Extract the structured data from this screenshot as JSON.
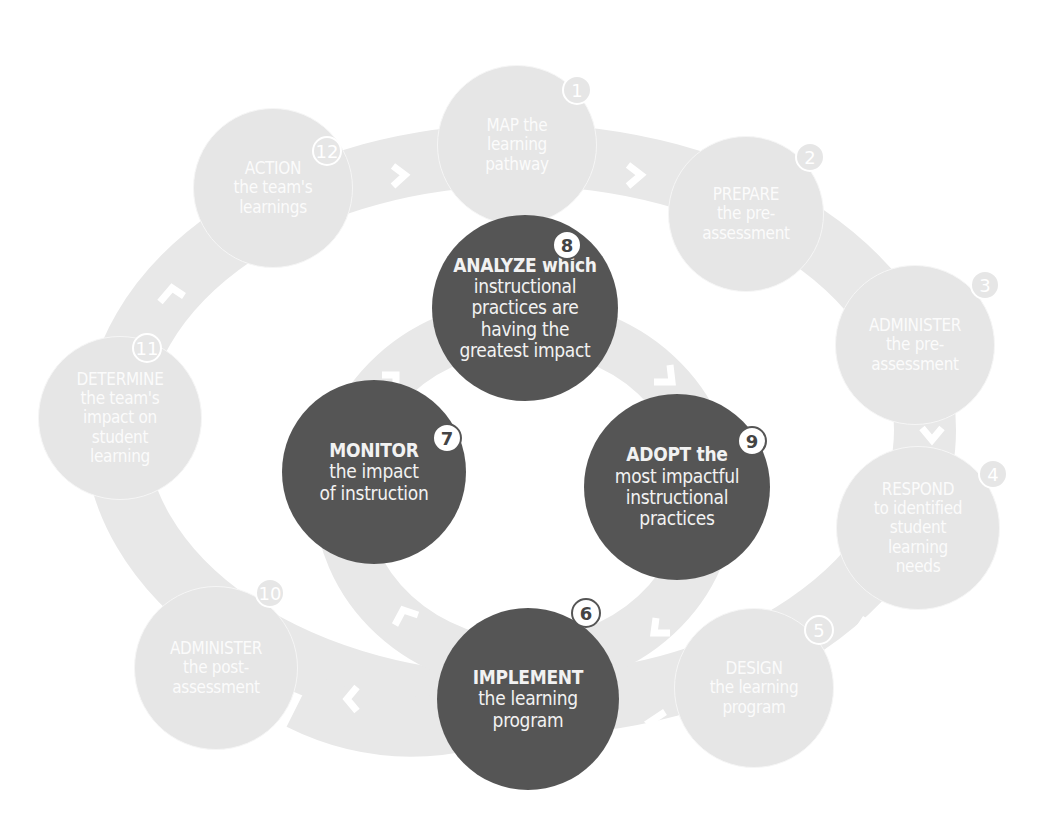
{
  "colors": {
    "outer_ring": "#e6e6e6",
    "outer_circle": "#e6e6e6",
    "inner_ring": "#e6e6e6",
    "inner_circle": "#555555",
    "text": "#ffffff",
    "background": "#ffffff"
  },
  "outer_cycle": {
    "steps": [
      {
        "number": "1",
        "verb": "MAP",
        "rest": "the learning pathway",
        "lines": [
          "MAP the",
          "learning",
          "pathway"
        ]
      },
      {
        "number": "2",
        "verb": "PREPARE",
        "rest": "the pre-assessment",
        "lines": [
          "PREPARE",
          "the pre-",
          "assessment"
        ]
      },
      {
        "number": "3",
        "verb": "ADMINISTER",
        "rest": "the pre-assessment",
        "lines": [
          "ADMINISTER",
          "the pre-",
          "assessment"
        ]
      },
      {
        "number": "4",
        "verb": "RESPOND",
        "rest": "to identified student learning needs",
        "lines": [
          "RESPOND",
          "to identified",
          "student",
          "learning",
          "needs"
        ]
      },
      {
        "number": "5",
        "verb": "DESIGN",
        "rest": "the learning program",
        "lines": [
          "DESIGN",
          "the learning",
          "program"
        ]
      },
      {
        "number": "10",
        "verb": "ADMINISTER",
        "rest": "the post-assessment",
        "lines": [
          "ADMINISTER",
          "the post-",
          "assessment"
        ]
      },
      {
        "number": "11",
        "verb": "DETERMINE",
        "rest": "the team's impact on student learning",
        "lines": [
          "DETERMINE",
          "the team's",
          "impact on",
          "student",
          "learning"
        ]
      },
      {
        "number": "12",
        "verb": "ACTION",
        "rest": "the team's learnings",
        "lines": [
          "ACTION",
          "the team's",
          "learnings"
        ]
      }
    ]
  },
  "inner_cycle": {
    "steps": [
      {
        "number": "6",
        "verb": "IMPLEMENT",
        "rest": "the learning program",
        "lines": [
          "IMPLEMENT",
          "the learning",
          "program"
        ]
      },
      {
        "number": "7",
        "verb": "MONITOR",
        "rest": "the impact of instruction",
        "lines": [
          "MONITOR",
          "the impact",
          "of instruction"
        ]
      },
      {
        "number": "8",
        "verb": "ANALYZE",
        "rest": "which instructional practices are having the greatest impact",
        "lines": [
          "ANALYZE which",
          "instructional",
          "practices are",
          "having the",
          "greatest impact"
        ]
      },
      {
        "number": "9",
        "verb": "ADOPT",
        "rest": "the most impactful instructional practices",
        "lines": [
          "ADOPT the",
          "most impactful",
          "instructional",
          "practices"
        ]
      }
    ]
  },
  "connectors": {
    "outer_arrow_icon": "chevron-icon",
    "inner_arrow_icon": "chevron-icon"
  }
}
